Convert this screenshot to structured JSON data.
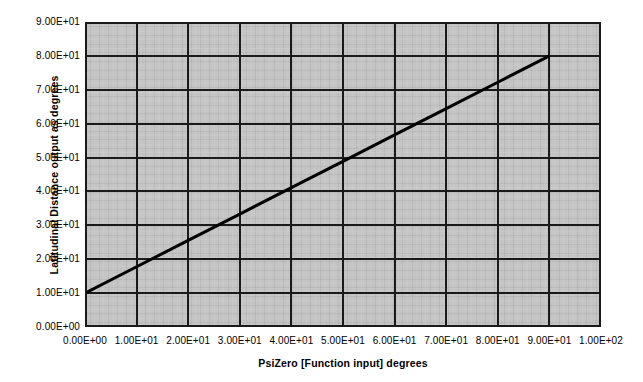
{
  "chart_data": {
    "type": "line",
    "title": "",
    "subtitle": "",
    "xlabel": "PsiZero [Function input] degrees",
    "ylabel": "Latitudinal Distance output as degrees",
    "xlim": [
      0,
      100
    ],
    "ylim": [
      0,
      90
    ],
    "xtick_values": [
      0,
      10,
      20,
      30,
      40,
      50,
      60,
      70,
      80,
      90,
      100
    ],
    "ytick_values": [
      0,
      10,
      20,
      30,
      40,
      50,
      60,
      70,
      80,
      90
    ],
    "xtick_labels": [
      "0.00E+00",
      "1.00E+01",
      "2.00E+01",
      "3.00E+01",
      "4.00E+01",
      "5.00E+01",
      "6.00E+01",
      "7.00E+01",
      "8.00E+01",
      "9.00E+01",
      "1.00E+02"
    ],
    "ytick_labels": [
      "0.00E+00",
      "1.00E+01",
      "2.00E+01",
      "3.00E+01",
      "4.00E+01",
      "5.00E+01",
      "6.00E+01",
      "7.00E+01",
      "8.00E+01",
      "9.00E+01"
    ],
    "grid": true,
    "grid_color": "#1a1a1a",
    "plot_background": "#c4c4c4",
    "figure_background": "#ffffff",
    "legend": false,
    "legend_position": "none",
    "annotations": [],
    "series": [
      {
        "name": "Latitudinal Distance",
        "color": "#000000",
        "line_width": 3,
        "marker": "none",
        "x": [
          0,
          10,
          20,
          30,
          40,
          50,
          60,
          70,
          80,
          90
        ],
        "values": [
          10.0,
          17.78,
          25.56,
          33.33,
          41.11,
          48.89,
          56.67,
          64.44,
          72.22,
          80.0
        ]
      }
    ]
  }
}
